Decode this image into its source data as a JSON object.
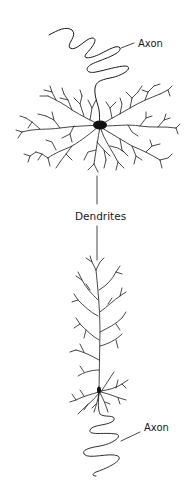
{
  "figure": {
    "type": "neuron-comparison-diagram",
    "labels": {
      "top_axon": "Axon",
      "dendrites": "Dendrites",
      "bottom_axon": "Axon"
    },
    "colors": {
      "ink": "#1a1a1a",
      "background": "#ffffff"
    },
    "neurons": [
      {
        "name": "multipolar-stellate-neuron",
        "position": "top",
        "parts": [
          "axon",
          "soma",
          "dendrites"
        ]
      },
      {
        "name": "pyramidal-neuron",
        "position": "bottom",
        "parts": [
          "apical-dendrite",
          "soma",
          "basal-dendrites",
          "axon"
        ]
      }
    ]
  }
}
